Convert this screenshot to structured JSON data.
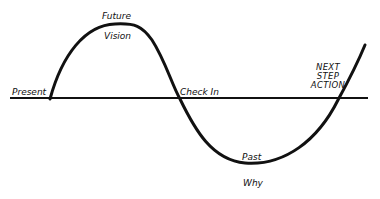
{
  "diagram": {
    "type": "wave-cycle",
    "colors": {
      "stroke": "#111111",
      "background": "#ffffff"
    },
    "labels": {
      "present": "Present",
      "future": "Future",
      "vision": "Vision",
      "check_in": "Check In",
      "past": "Past",
      "why": "Why",
      "next_step_line1": "NEXT",
      "next_step_line2": "STEP",
      "next_step_line3": "ACTION"
    }
  }
}
